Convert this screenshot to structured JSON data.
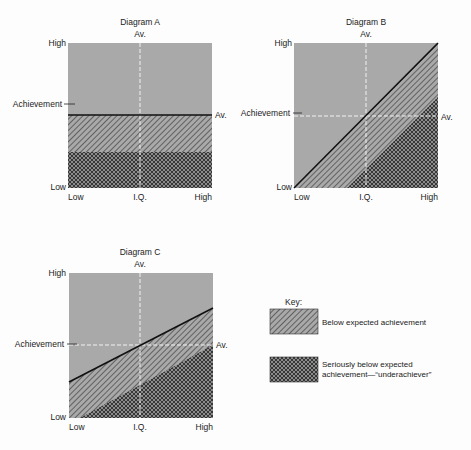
{
  "diagrams": [
    {
      "title": "Diagram A",
      "y_axis_label": "Achievement",
      "y_high": "High",
      "y_low": "Low",
      "x_axis_label": "I.Q.",
      "x_low": "Low",
      "x_high": "High",
      "x_average": "Av.",
      "y_average": "Av."
    },
    {
      "title": "Diagram B",
      "y_axis_label": "Achievement",
      "y_high": "High",
      "y_low": "Low",
      "x_axis_label": "I.Q.",
      "x_low": "Low",
      "x_high": "High",
      "x_average": "Av.",
      "y_average": "Av."
    },
    {
      "title": "Diagram C",
      "y_axis_label": "Achievement",
      "y_high": "High",
      "y_low": "Low",
      "x_axis_label": "I.Q.",
      "x_low": "Low",
      "x_high": "High",
      "x_average": "Av.",
      "y_average": "Av."
    }
  ],
  "key": {
    "title": "Key:",
    "items": [
      {
        "label": "Below expected achievement",
        "pattern": "diagonal-hatch"
      },
      {
        "label": "Seriously below expected achievement—“underachiever”",
        "pattern": "cross-hatch"
      }
    ]
  },
  "colors": {
    "background_gray": "#a9a9a9",
    "hatch_line": "#3a3a3a",
    "boundary_line": "#111111",
    "dashed_average": "#f2f2f2"
  }
}
